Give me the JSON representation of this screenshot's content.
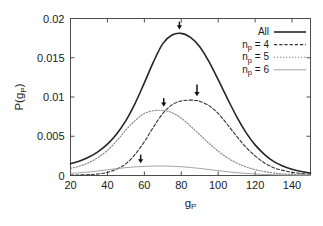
{
  "chart_data": {
    "type": "line",
    "title": "",
    "xlabel": "g_P",
    "xlabel_main": "g",
    "xlabel_sub": "P",
    "ylabel": "P(g_P)",
    "ylabel_main_1": "P(g",
    "ylabel_sub": "P",
    "ylabel_main_2": ")",
    "xlim": [
      20,
      150
    ],
    "ylim": [
      0,
      0.02
    ],
    "xticks": [
      20,
      40,
      60,
      80,
      100,
      120,
      140
    ],
    "xtick_labels": [
      "20",
      "40",
      "60",
      "80",
      "100",
      "120",
      "140"
    ],
    "yticks": [
      0,
      0.005,
      0.01,
      0.015,
      0.02
    ],
    "ytick_labels": [
      "0",
      "0.005",
      "0.01",
      "0.015",
      "0.02"
    ],
    "grid": false,
    "legend_position": "top-right",
    "series": [
      {
        "name": "All",
        "label": "All",
        "style": "solid",
        "color": "#262626",
        "width": 1.6,
        "peak_x": 80,
        "peak_y": 0.0181,
        "x": [
          20,
          25,
          30,
          35,
          40,
          45,
          50,
          55,
          60,
          65,
          70,
          75,
          80,
          85,
          90,
          95,
          100,
          105,
          110,
          115,
          120,
          125,
          130,
          135,
          140,
          145,
          150
        ],
        "y": [
          0.0015,
          0.00185,
          0.00235,
          0.00305,
          0.004,
          0.0053,
          0.007,
          0.0092,
          0.0118,
          0.0145,
          0.0168,
          0.0179,
          0.0181,
          0.0176,
          0.0164,
          0.0145,
          0.0122,
          0.0098,
          0.0075,
          0.0055,
          0.0039,
          0.0027,
          0.0018,
          0.0012,
          0.0008,
          0.0005,
          0.0003
        ]
      },
      {
        "name": "n_p = 4",
        "label_main": "n",
        "label_sub": "p",
        "label_rest": " = 4",
        "style": "dashed",
        "color": "#333333",
        "width": 1.1,
        "peak_x": 88,
        "peak_y": 0.0096,
        "x": [
          20,
          25,
          30,
          35,
          40,
          45,
          50,
          55,
          60,
          65,
          70,
          75,
          80,
          85,
          88,
          90,
          95,
          100,
          105,
          110,
          115,
          120,
          125,
          130,
          135,
          140,
          145,
          150
        ],
        "y": [
          5e-05,
          7e-05,
          0.00012,
          0.0002,
          0.0004,
          0.0008,
          0.0015,
          0.0027,
          0.0043,
          0.0062,
          0.0079,
          0.009,
          0.0095,
          0.0096,
          0.00955,
          0.00945,
          0.0089,
          0.0079,
          0.0065,
          0.005,
          0.0036,
          0.0025,
          0.0016,
          0.001,
          0.00065,
          0.0004,
          0.00025,
          0.00015
        ]
      },
      {
        "name": "n_p = 5",
        "label_main": "n",
        "label_sub": "p",
        "label_rest": " = 5",
        "style": "dotted",
        "color": "#808080",
        "width": 1.1,
        "peak_x": 70,
        "peak_y": 0.0083,
        "x": [
          20,
          25,
          30,
          35,
          40,
          45,
          50,
          55,
          60,
          65,
          70,
          75,
          80,
          85,
          90,
          95,
          100,
          105,
          110,
          115,
          120,
          125,
          130,
          135,
          140,
          145,
          150
        ],
        "y": [
          0.0009,
          0.0012,
          0.00165,
          0.0023,
          0.0032,
          0.0044,
          0.0058,
          0.007,
          0.0079,
          0.00825,
          0.0083,
          0.008,
          0.0073,
          0.0063,
          0.0052,
          0.0041,
          0.0031,
          0.00225,
          0.0016,
          0.0011,
          0.00075,
          0.0005,
          0.00032,
          0.0002,
          0.00013,
          8e-05,
          5e-05
        ]
      },
      {
        "name": "n_p = 6",
        "label_main": "n",
        "label_sub": "p",
        "label_rest": " = 6",
        "style": "thin-solid",
        "color": "#999999",
        "width": 0.9,
        "peak_x": 70,
        "peak_y": 0.0012,
        "x": [
          20,
          25,
          30,
          35,
          40,
          45,
          50,
          55,
          60,
          65,
          70,
          75,
          80,
          85,
          90,
          95,
          100,
          105,
          110,
          115,
          120,
          125,
          130,
          135,
          140,
          145,
          150
        ],
        "y": [
          0.00028,
          0.00035,
          0.00045,
          0.00058,
          0.00072,
          0.00088,
          0.001,
          0.0011,
          0.00116,
          0.0012,
          0.00121,
          0.00118,
          0.00112,
          0.00102,
          0.0009,
          0.00076,
          0.00062,
          0.00048,
          0.00036,
          0.00027,
          0.00019,
          0.00013,
          9e-05,
          6e-05,
          4e-05,
          3e-05,
          2e-05
        ]
      }
    ],
    "annotations": [
      {
        "name": "arrow-all",
        "x": 79,
        "y_top": 0.0196,
        "y_tip": 0.0186,
        "series": "All"
      },
      {
        "name": "arrow-np4",
        "x": 88.5,
        "y_top": 0.0116,
        "y_tip": 0.0101,
        "series": "n_p = 4"
      },
      {
        "name": "arrow-np5",
        "x": 70.5,
        "y_top": 0.00985,
        "y_tip": 0.00875,
        "series": "n_p = 5"
      },
      {
        "name": "arrow-np6",
        "x": 58,
        "y_top": 0.00265,
        "y_tip": 0.00155,
        "series": "n_p = 6"
      }
    ]
  },
  "legend": {
    "entries": [
      {
        "label": "All",
        "sub": "",
        "rest": ""
      },
      {
        "label": "n",
        "sub": "p",
        "rest": " = 4"
      },
      {
        "label": "n",
        "sub": "p",
        "rest": " = 5"
      },
      {
        "label": "n",
        "sub": "p",
        "rest": " = 6"
      }
    ]
  }
}
